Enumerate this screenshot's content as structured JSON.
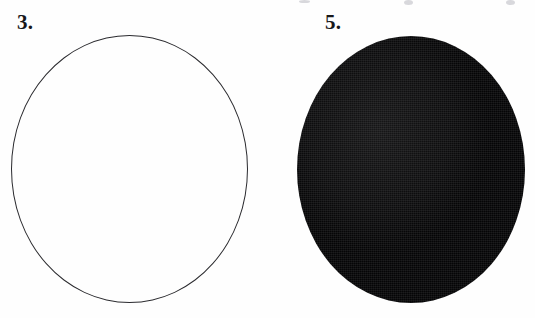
{
  "page": {
    "width": 535,
    "height": 318,
    "background_color": "#fefefe"
  },
  "figures": [
    {
      "number_label": "3.",
      "shape": "ellipse",
      "fill": "none",
      "stroke_color": "#2b2b2f",
      "stroke_width_px": 1,
      "bounds": {
        "x": 11,
        "y": 35,
        "width": 237,
        "height": 268
      }
    },
    {
      "number_label": "5.",
      "shape": "ellipse",
      "fill": "solid",
      "fill_color": "#050506",
      "stroke_color": "none",
      "texture": "halftone-dither",
      "bounds": {
        "x": 297,
        "y": 36,
        "width": 228,
        "height": 267
      }
    }
  ],
  "artifacts": {
    "top_edge_marks": [
      {
        "x": 299,
        "width": 11,
        "color": "#e4e4e8"
      },
      {
        "x": 404,
        "width": 9,
        "color": "#b9b9c0"
      },
      {
        "x": 506,
        "width": 9,
        "color": "#b9b9c0"
      }
    ]
  }
}
